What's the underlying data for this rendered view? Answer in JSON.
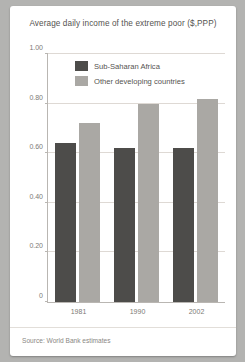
{
  "chart_data": {
    "type": "bar",
    "title": "Average daily income of the extreme poor ($,PPP)",
    "xlabel": "",
    "ylabel": "",
    "categories": [
      "1981",
      "1990",
      "2002"
    ],
    "series": [
      {
        "name": "Sub-Saharan Africa",
        "color": "#4d4c4a",
        "values": [
          0.64,
          0.62,
          0.62
        ]
      },
      {
        "name": "Other developing countries",
        "color": "#aaa8a4",
        "values": [
          0.72,
          0.8,
          0.82
        ]
      }
    ],
    "ylim": [
      0,
      1.0
    ],
    "yticks": [
      0,
      0.2,
      0.4,
      0.6,
      0.8,
      1.0
    ],
    "ytick_labels": [
      "0",
      "0.20",
      "0.40",
      "0.60",
      "0.80",
      "1.00"
    ],
    "grid": true,
    "legend_position": "top-center"
  },
  "footer": {
    "source": "Source: World Bank estimates"
  },
  "theme": {
    "page_background": "#b3b3b1",
    "card_background": "#ffffff",
    "text_color": "#555350",
    "axis_color": "#b9b6b2",
    "grid_color": "#ded9d4"
  }
}
